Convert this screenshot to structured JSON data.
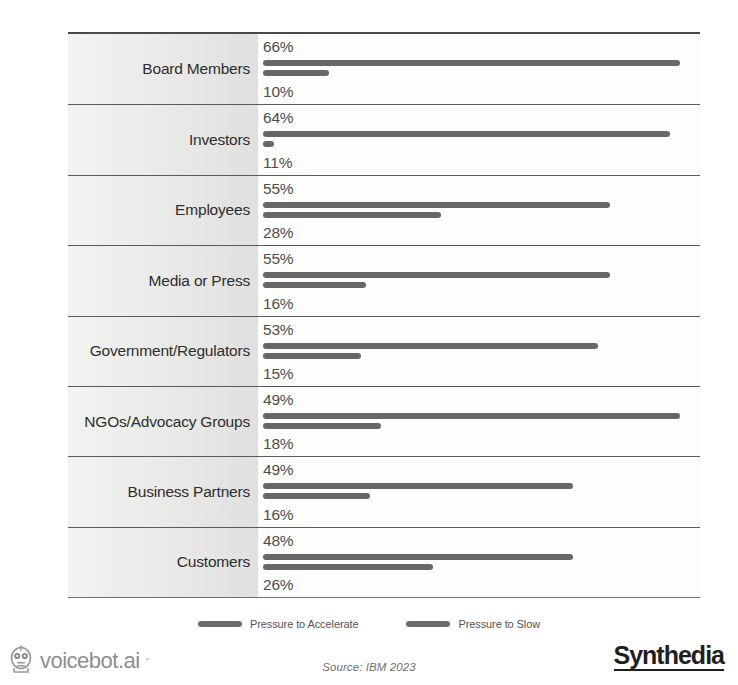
{
  "chart_data": {
    "type": "bar",
    "orientation": "horizontal",
    "title": "",
    "xlabel": "",
    "ylabel": "",
    "grid": false,
    "legend_position": "bottom-center",
    "xlim": [
      0,
      100
    ],
    "categories": [
      "Board Members",
      "Investors",
      "Employees",
      "Media or Press",
      "Government/Regulators",
      "NGOs/Advocacy Groups",
      "Business Partners",
      "Customers"
    ],
    "series": [
      {
        "name": "Pressure to Accelerate",
        "color": "#676767",
        "values": [
          66,
          64,
          55,
          55,
          53,
          49,
          49,
          48
        ],
        "labels": [
          "66%",
          "64%",
          "55%",
          "55%",
          "53%",
          "49%",
          "49%",
          "48%"
        ],
        "bar_pixel_widths": [
          417,
          407,
          347,
          347,
          335,
          417,
          310,
          310
        ]
      },
      {
        "name": "Pressure to Slow",
        "color": "#676767",
        "values": [
          10,
          11,
          28,
          16,
          15,
          18,
          16,
          26
        ],
        "labels": [
          "10%",
          "11%",
          "28%",
          "16%",
          "15%",
          "18%",
          "16%",
          "26%"
        ],
        "bar_pixel_widths": [
          66,
          11,
          178,
          103,
          98,
          118,
          107,
          170
        ]
      }
    ]
  },
  "legend": {
    "items": [
      {
        "label": "Pressure to Accelerate"
      },
      {
        "label": "Pressure to Slow"
      }
    ]
  },
  "footer": {
    "brand_left": "voicebot.ai",
    "brand_left_tm": "″",
    "brand_left_icon": "robot-head-icon",
    "source": "Source: IBM 2023",
    "brand_right": "Synthedia"
  },
  "colors": {
    "bar": "#676767",
    "frame": "#4a4a4a",
    "label_band": "#e8e8e6",
    "text": "#3a3a3a"
  }
}
